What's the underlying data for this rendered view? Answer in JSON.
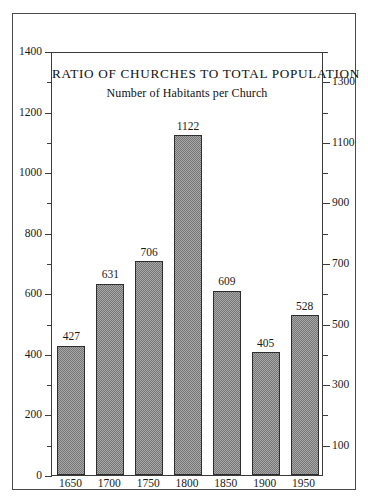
{
  "chart_data": {
    "type": "bar",
    "title": "RATIO OF CHURCHES TO TOTAL POPULATION",
    "subtitle": "Number of Habitants per Church",
    "xlabel": "",
    "ylabel": "",
    "categories": [
      "1650",
      "1700",
      "1750",
      "1800",
      "1850",
      "1900",
      "1950"
    ],
    "values": [
      427,
      631,
      706,
      1122,
      609,
      405,
      528
    ],
    "value_labels": [
      "427",
      "631",
      "706",
      "1122",
      "609",
      "405",
      "528"
    ],
    "ylim": [
      0,
      1400
    ],
    "grid": false,
    "legend": null,
    "left_axis": {
      "ticks_major": [
        0,
        200,
        400,
        600,
        800,
        1000,
        1200,
        1400
      ],
      "tick_labels": [
        "0",
        "200",
        "400",
        "600",
        "800",
        "1000",
        "1200",
        "1400"
      ],
      "ticks_minor": [
        100,
        300,
        500,
        700,
        900,
        1100,
        1300
      ]
    },
    "right_axis": {
      "ticks_major": [
        100,
        300,
        500,
        700,
        900,
        1100,
        1300
      ],
      "tick_labels": [
        "100",
        "300",
        "500",
        "700",
        "900",
        "1100",
        "1300"
      ],
      "ticks_minor": [
        200,
        400,
        600,
        800,
        1000,
        1200,
        1400
      ]
    },
    "colors": {
      "bar_fill": "#a8a8a8",
      "bar_hatch": "#767676",
      "bar_border": "#2e2e2e",
      "axis": "#3b3b3b",
      "frame": "#4a4a4a",
      "text": "#1a1a1a",
      "background": "#ffffff"
    }
  }
}
